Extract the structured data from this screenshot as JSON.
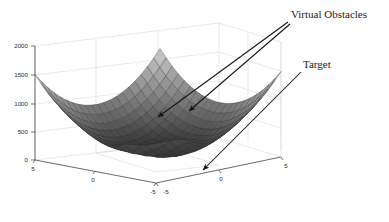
{
  "figure": {
    "kind": "matlab-3d-surface-plot",
    "background_color": "#ffffff",
    "mesh_line_color": "#3a3a3a",
    "axis_line_color": "#4d4d4d",
    "grid_line_color": "#d8d8d8",
    "annotation_color": "#141414"
  },
  "annotations": [
    {
      "id": "virtual-obstacles",
      "label": "Virtual Obstacles"
    },
    {
      "id": "target",
      "label": "Target"
    }
  ],
  "axes": {
    "z": {
      "ticks": [
        "2000",
        "1500",
        "1000",
        "500",
        "0"
      ],
      "values": [
        2000,
        1500,
        1000,
        500,
        0
      ]
    },
    "y": {
      "ticks": [
        "5",
        "0",
        "-5"
      ],
      "values": [
        5,
        0,
        -5
      ]
    },
    "x": {
      "ticks": [
        "-5",
        "0",
        "5"
      ],
      "values": [
        -5,
        0,
        5
      ]
    }
  },
  "chart_data": {
    "type": "surface",
    "title": "",
    "xlabel": "",
    "ylabel": "",
    "zlabel": "",
    "xlim": [
      -5,
      5
    ],
    "ylim": [
      -5,
      5
    ],
    "zlim": [
      0,
      2000
    ],
    "xticks": [
      -5,
      0,
      5
    ],
    "yticks": [
      -5,
      0,
      5
    ],
    "zticks": [
      0,
      500,
      1000,
      1500,
      2000
    ],
    "grid": true,
    "colormap": "gray",
    "mesh_n": 21,
    "legend": null,
    "surface_model": {
      "base": "bowl = 30*(x^2 + y^2)",
      "bumps": [
        {
          "amplitude": 320,
          "cx": -0.9,
          "cy": 0.5,
          "sigma": 0.85
        },
        {
          "amplitude": 300,
          "cx": 0.9,
          "cy": -0.2,
          "sigma": 0.85
        }
      ]
    },
    "annotation_points": [
      {
        "label": "Virtual Obstacles",
        "target_px": [
          155,
          116
        ]
      },
      {
        "label": "Virtual Obstacles",
        "target_px": [
          186,
          110
        ]
      },
      {
        "label": "Target",
        "target_px": [
          201,
          171
        ]
      }
    ]
  }
}
